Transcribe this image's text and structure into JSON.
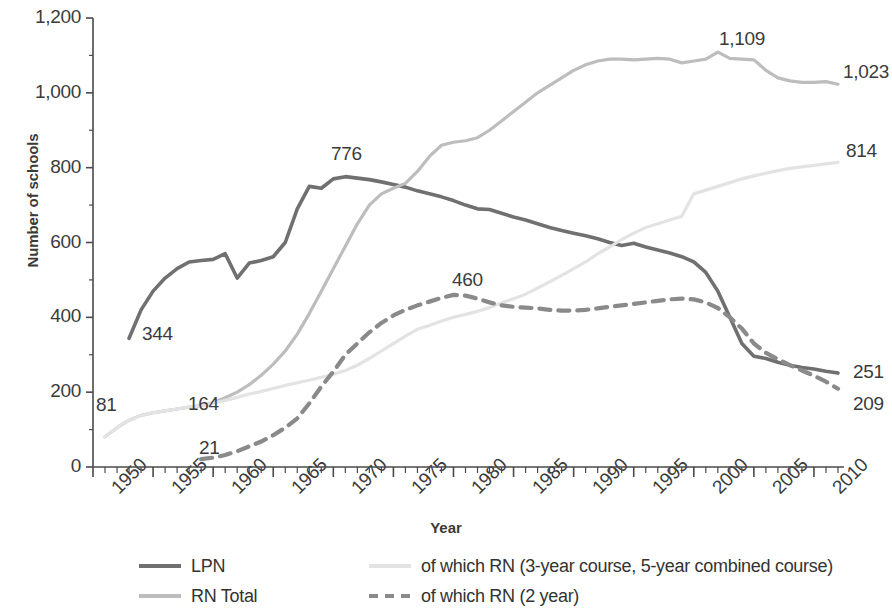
{
  "chart_data": {
    "type": "line",
    "title": "",
    "xlabel": "Year",
    "ylabel": "Number of schools",
    "xlim": [
      1950,
      2012
    ],
    "ylim": [
      0,
      1200
    ],
    "ytick_labels": [
      "0",
      "200",
      "400",
      "600",
      "800",
      "1,000",
      "1,200"
    ],
    "ytick_values": [
      0,
      200,
      400,
      600,
      800,
      1000,
      1200
    ],
    "xtick_labels": [
      "1950",
      "1955",
      "1960",
      "1965",
      "1970",
      "1975",
      "1980",
      "1985",
      "1990",
      "1995",
      "2000",
      "2005",
      "2010"
    ],
    "xtick_values": [
      1950,
      1955,
      1960,
      1965,
      1970,
      1975,
      1980,
      1985,
      1990,
      1995,
      2000,
      2005,
      2010
    ],
    "minor_tick_interval": 1,
    "grid": false,
    "legend_position": "bottom",
    "series": [
      {
        "name": "LPN",
        "color": "#707070",
        "style": "solid",
        "width": 3.6,
        "x": [
          1953,
          1954,
          1955,
          1956,
          1957,
          1958,
          1959,
          1960,
          1961,
          1962,
          1963,
          1964,
          1965,
          1966,
          1967,
          1968,
          1969,
          1970,
          1971,
          1972,
          1973,
          1974,
          1975,
          1976,
          1977,
          1978,
          1979,
          1980,
          1981,
          1982,
          1983,
          1984,
          1985,
          1986,
          1987,
          1988,
          1989,
          1990,
          1991,
          1992,
          1993,
          1994,
          1995,
          1996,
          1997,
          1998,
          1999,
          2000,
          2001,
          2002,
          2003,
          2004,
          2005,
          2006,
          2007,
          2008,
          2009,
          2010,
          2011,
          2012
        ],
        "y": [
          344,
          420,
          470,
          505,
          530,
          548,
          552,
          555,
          570,
          505,
          545,
          552,
          562,
          600,
          690,
          750,
          745,
          770,
          776,
          772,
          768,
          762,
          755,
          748,
          738,
          730,
          722,
          712,
          700,
          690,
          688,
          678,
          668,
          660,
          650,
          640,
          632,
          625,
          618,
          610,
          600,
          592,
          598,
          588,
          580,
          572,
          562,
          548,
          520,
          470,
          400,
          330,
          296,
          290,
          280,
          272,
          266,
          262,
          256,
          251
        ]
      },
      {
        "name": "RN Total",
        "color": "#bdbdbd",
        "style": "solid",
        "width": 3.2,
        "x": [
          1951,
          1952,
          1953,
          1954,
          1955,
          1956,
          1957,
          1958,
          1959,
          1960,
          1961,
          1962,
          1963,
          1964,
          1965,
          1966,
          1967,
          1968,
          1969,
          1970,
          1971,
          1972,
          1973,
          1974,
          1975,
          1976,
          1977,
          1978,
          1979,
          1980,
          1981,
          1982,
          1983,
          1984,
          1985,
          1986,
          1987,
          1988,
          1989,
          1990,
          1991,
          1992,
          1993,
          1994,
          1995,
          1996,
          1997,
          1998,
          1999,
          2000,
          2001,
          2002,
          2003,
          2004,
          2005,
          2006,
          2007,
          2008,
          2009,
          2010,
          2011,
          2012
        ],
        "y": [
          81,
          105,
          125,
          138,
          145,
          150,
          155,
          160,
          164,
          172,
          185,
          200,
          220,
          245,
          275,
          310,
          355,
          410,
          470,
          530,
          590,
          650,
          700,
          730,
          745,
          758,
          790,
          830,
          860,
          868,
          872,
          880,
          900,
          925,
          950,
          975,
          1000,
          1020,
          1040,
          1060,
          1075,
          1085,
          1090,
          1090,
          1088,
          1090,
          1092,
          1090,
          1080,
          1085,
          1090,
          1109,
          1092,
          1090,
          1088,
          1060,
          1040,
          1032,
          1028,
          1028,
          1030,
          1023
        ]
      },
      {
        "name": "of which RN (3-year course, 5-year combined course)",
        "color": "#e3e3e3",
        "style": "solid",
        "width": 3.2,
        "x": [
          1951,
          1952,
          1953,
          1954,
          1955,
          1956,
          1957,
          1958,
          1959,
          1960,
          1961,
          1962,
          1963,
          1964,
          1965,
          1966,
          1967,
          1968,
          1969,
          1970,
          1971,
          1972,
          1973,
          1974,
          1975,
          1976,
          1977,
          1978,
          1979,
          1980,
          1981,
          1982,
          1983,
          1984,
          1985,
          1986,
          1987,
          1988,
          1989,
          1990,
          1991,
          1992,
          1993,
          1994,
          1995,
          1996,
          1997,
          1998,
          1999,
          2000,
          2001,
          2002,
          2003,
          2004,
          2005,
          2006,
          2007,
          2008,
          2009,
          2010,
          2011,
          2012
        ],
        "y": [
          81,
          105,
          125,
          138,
          145,
          150,
          155,
          160,
          164,
          170,
          178,
          186,
          195,
          202,
          210,
          218,
          225,
          232,
          240,
          248,
          258,
          272,
          290,
          310,
          330,
          350,
          368,
          378,
          390,
          400,
          408,
          416,
          426,
          438,
          450,
          462,
          478,
          495,
          512,
          530,
          548,
          570,
          588,
          608,
          625,
          640,
          650,
          660,
          670,
          730,
          740,
          750,
          760,
          770,
          778,
          785,
          792,
          798,
          802,
          806,
          810,
          814
        ]
      },
      {
        "name": "of which RN (2 year)",
        "color": "#8a8a8a",
        "style": "dashed",
        "width": 4.2,
        "x": [
          1959,
          1960,
          1961,
          1962,
          1963,
          1964,
          1965,
          1966,
          1967,
          1968,
          1969,
          1970,
          1971,
          1972,
          1973,
          1974,
          1975,
          1976,
          1977,
          1978,
          1979,
          1980,
          1981,
          1982,
          1983,
          1984,
          1985,
          1986,
          1987,
          1988,
          1989,
          1990,
          1991,
          1992,
          1993,
          1994,
          1995,
          1996,
          1997,
          1998,
          1999,
          2000,
          2001,
          2002,
          2003,
          2004,
          2005,
          2006,
          2007,
          2008,
          2009,
          2010,
          2011,
          2012
        ],
        "y": [
          21,
          25,
          32,
          42,
          55,
          68,
          85,
          105,
          130,
          170,
          215,
          255,
          300,
          330,
          360,
          385,
          405,
          420,
          432,
          442,
          452,
          460,
          458,
          450,
          440,
          432,
          428,
          426,
          424,
          420,
          418,
          418,
          420,
          424,
          428,
          432,
          436,
          440,
          444,
          448,
          450,
          448,
          440,
          425,
          400,
          370,
          330,
          305,
          288,
          272,
          258,
          244,
          228,
          209
        ]
      }
    ],
    "annotations": [
      {
        "text": "81",
        "x": 1951,
        "y": 81,
        "px": 96,
        "py": 394
      },
      {
        "text": "344",
        "x": 1953,
        "y": 344,
        "px": 142,
        "py": 323
      },
      {
        "text": "164",
        "x": 1959,
        "y": 164,
        "px": 188,
        "py": 393
      },
      {
        "text": "21",
        "x": 1959,
        "y": 21,
        "px": 199,
        "py": 437
      },
      {
        "text": "776",
        "x": 1971,
        "y": 776,
        "px": 331,
        "py": 143
      },
      {
        "text": "460",
        "x": 1980,
        "y": 460,
        "px": 452,
        "py": 269
      },
      {
        "text": "1,109",
        "x": 2002,
        "y": 1109,
        "px": 719,
        "py": 28
      },
      {
        "text": "1,023",
        "x": 2012,
        "y": 1023,
        "px": 843,
        "py": 61
      },
      {
        "text": "814",
        "x": 2012,
        "y": 814,
        "px": 846,
        "py": 140
      },
      {
        "text": "251",
        "x": 2012,
        "y": 251,
        "px": 853,
        "py": 361
      },
      {
        "text": "209",
        "x": 2012,
        "y": 209,
        "px": 853,
        "py": 393
      }
    ]
  },
  "legend": {
    "entries": [
      {
        "label": "LPN",
        "color": "#707070",
        "style": "solid"
      },
      {
        "label": "RN Total",
        "color": "#bdbdbd",
        "style": "solid"
      },
      {
        "label": "of which RN (3-year course, 5-year combined course)",
        "color": "#e3e3e3",
        "style": "solid"
      },
      {
        "label": "of which RN (2 year)",
        "color": "#8a8a8a",
        "style": "dashed"
      }
    ]
  },
  "colors": {
    "axis": "#4a4a4a",
    "text": "#3b3b3b",
    "background": "#ffffff"
  }
}
